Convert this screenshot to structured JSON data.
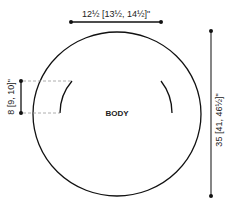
{
  "diagram": {
    "piece_label": "BODY",
    "width_dimension": {
      "main": "12",
      "main_frac": "1/2",
      "rest": "[13½, 14½]\"",
      "full": "12½ [13½, 14½]\""
    },
    "height_dimension": "35 [41, 46½]\"",
    "armhole_dimension": "8 [9, 10]\"",
    "colors": {
      "line": "#111111",
      "dash": "#999999"
    }
  }
}
